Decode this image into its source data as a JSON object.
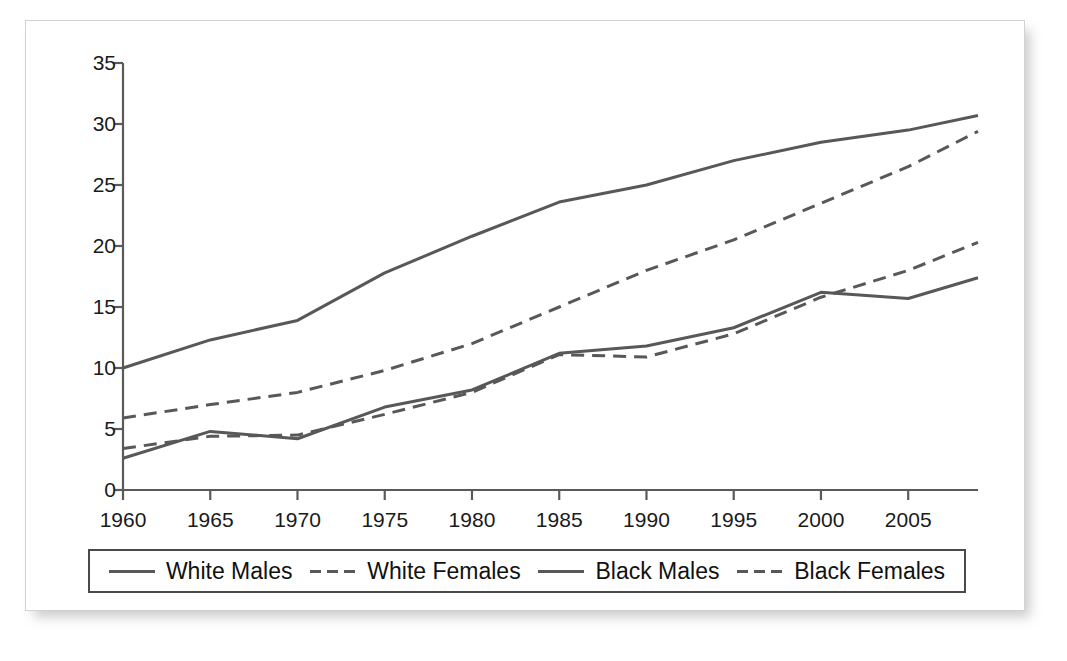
{
  "chart_data": {
    "type": "line",
    "title": "",
    "subtitle": "",
    "xlabel": "",
    "ylabel": "",
    "xlim": [
      1960,
      2009
    ],
    "ylim": [
      0,
      35
    ],
    "grid": false,
    "legend_position": "bottom",
    "x": [
      1960,
      1965,
      1970,
      1975,
      1980,
      1985,
      1990,
      1995,
      2000,
      2005,
      2009
    ],
    "xticks": [
      "1960",
      "1965",
      "1970",
      "1975",
      "1980",
      "1985",
      "1990",
      "1995",
      "2000",
      "2005"
    ],
    "xtick_values": [
      1960,
      1965,
      1970,
      1975,
      1980,
      1985,
      1990,
      1995,
      2000,
      2005
    ],
    "yticks": [
      "0",
      "5",
      "10",
      "15",
      "20",
      "25",
      "30",
      "35"
    ],
    "ytick_values": [
      0,
      5,
      10,
      15,
      20,
      25,
      30,
      35
    ],
    "line_color": "#585858",
    "series": [
      {
        "name": "White Males",
        "style": "solid",
        "color": "#585858",
        "values": [
          10.0,
          12.3,
          13.9,
          17.8,
          20.8,
          23.6,
          25.0,
          27.0,
          28.5,
          29.5,
          30.7
        ]
      },
      {
        "name": "White Females",
        "style": "dashed",
        "color": "#585858",
        "values": [
          5.9,
          7.0,
          8.0,
          9.8,
          12.0,
          15.0,
          18.0,
          20.5,
          23.5,
          26.5,
          29.4
        ]
      },
      {
        "name": "Black Males",
        "style": "solid",
        "color": "#585858",
        "values": [
          2.6,
          4.8,
          4.2,
          6.8,
          8.2,
          11.2,
          11.8,
          13.3,
          16.2,
          15.7,
          17.4
        ]
      },
      {
        "name": "Black Females",
        "style": "dashed",
        "color": "#585858",
        "values": [
          3.4,
          4.4,
          4.5,
          6.2,
          8.0,
          11.1,
          10.9,
          12.8,
          15.8,
          18.0,
          20.3
        ]
      }
    ]
  },
  "legend": {
    "items": [
      {
        "label": "White Males",
        "style": "solid"
      },
      {
        "label": "White Females",
        "style": "dashed"
      },
      {
        "label": "Black Males",
        "style": "solid"
      },
      {
        "label": "Black Females",
        "style": "dashed"
      }
    ]
  }
}
